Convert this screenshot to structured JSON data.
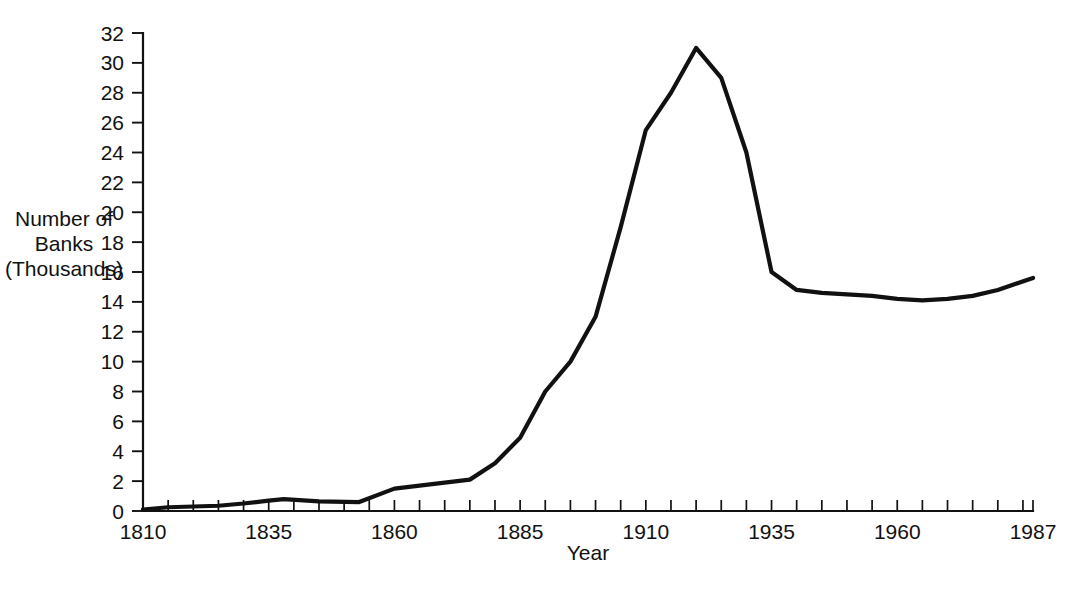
{
  "chart_data": {
    "type": "line",
    "title": "",
    "subtitle": "",
    "xlabel": "Year",
    "ylabel": "Number of Banks (Thousands)",
    "ylabel_lines": [
      "Number of",
      "Banks",
      "(Thousands)"
    ],
    "xlim": [
      1810,
      1987
    ],
    "ylim": [
      0,
      32
    ],
    "grid": false,
    "legend": false,
    "legend_position": "none",
    "line_color": "#111111",
    "background_color": "#ffffff",
    "x_tick_labels": [
      "1810",
      "1835",
      "1860",
      "1885",
      "1910",
      "1935",
      "1960",
      "1987"
    ],
    "x_tick_values": [
      1810,
      1835,
      1860,
      1885,
      1910,
      1935,
      1960,
      1987
    ],
    "x_minor_tick_step": 5,
    "y_tick_labels": [
      "0",
      "2",
      "4",
      "6",
      "8",
      "10",
      "12",
      "14",
      "16",
      "18",
      "20",
      "22",
      "24",
      "26",
      "28",
      "30",
      "32"
    ],
    "y_tick_values": [
      0,
      2,
      4,
      6,
      8,
      10,
      12,
      14,
      16,
      18,
      20,
      22,
      24,
      26,
      28,
      30,
      32
    ],
    "series": [
      {
        "name": "Number of Banks",
        "x": [
          1810,
          1815,
          1820,
          1825,
          1830,
          1835,
          1838,
          1845,
          1853,
          1860,
          1865,
          1870,
          1875,
          1880,
          1885,
          1890,
          1895,
          1900,
          1905,
          1910,
          1915,
          1920,
          1925,
          1930,
          1935,
          1940,
          1945,
          1950,
          1955,
          1960,
          1965,
          1970,
          1975,
          1980,
          1987
        ],
        "y": [
          0.1,
          0.25,
          0.3,
          0.35,
          0.5,
          0.7,
          0.8,
          0.65,
          0.6,
          1.5,
          1.7,
          1.9,
          2.1,
          3.2,
          4.9,
          8.0,
          10.0,
          13.0,
          19.0,
          25.5,
          28.0,
          31.0,
          29.0,
          24.0,
          16.0,
          14.8,
          14.6,
          14.5,
          14.4,
          14.2,
          14.1,
          14.2,
          14.4,
          14.8,
          15.6
        ]
      }
    ]
  },
  "labels": {
    "x_axis_title": "Year",
    "y_axis_title_l1": "Number of",
    "y_axis_title_l2": "Banks",
    "y_axis_title_l3": "(Thousands)"
  }
}
